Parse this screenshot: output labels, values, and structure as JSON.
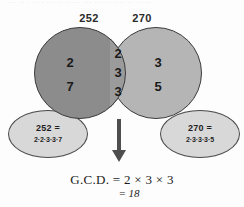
{
  "figure": {
    "top_remnant_text": "··· ·· · ···· ··· ·· ····· ··· ······ ···· ·· ·····",
    "left_label": "252",
    "right_label": "270",
    "left_bubble": {
      "title": "252 =",
      "factors": "2·2·3·3·7"
    },
    "right_bubble": {
      "title": "270 =",
      "factors": "2·3·3·3·5"
    },
    "left_only_factors": [
      "2",
      "7"
    ],
    "intersection_factors": [
      "2",
      "3",
      "3"
    ],
    "right_only_factors": [
      "3",
      "5"
    ],
    "result_line1": "G.C.D. = 2 × 3 × 3",
    "result_line2": "= 18",
    "colors": {
      "left_circle": "#8c8c8c",
      "right_circle": "#b5b5b5",
      "intersection": "#9b9b9b",
      "bubble": "#d8d8d8",
      "outline": "#3c3c3c",
      "arrow": "#4e4e4e",
      "text": "#1a1a1a",
      "background": "#fdfdfd"
    }
  }
}
